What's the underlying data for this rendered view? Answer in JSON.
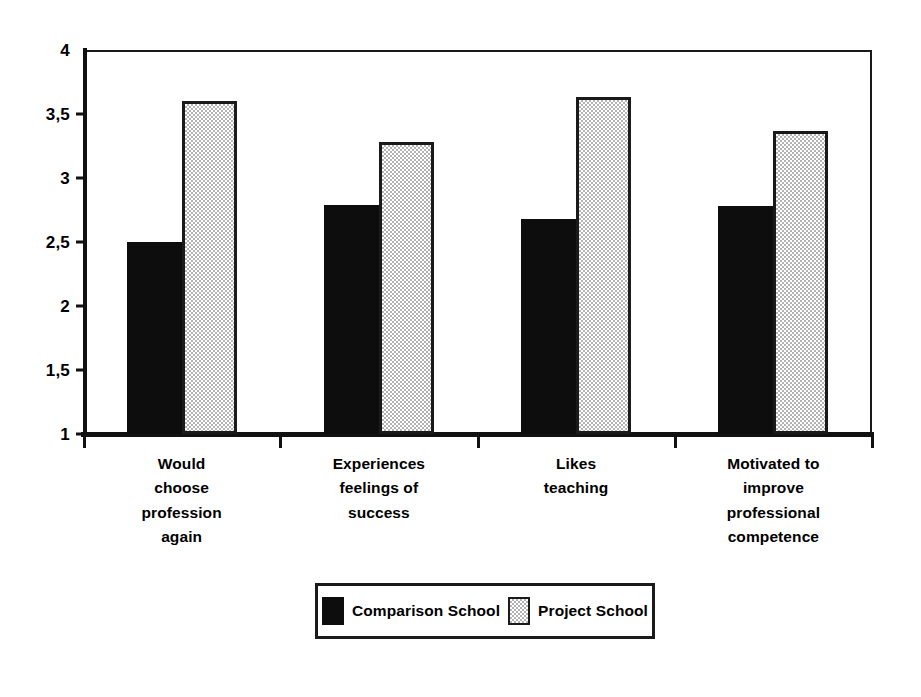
{
  "chart_data": {
    "type": "bar",
    "title": "",
    "subtitle": "",
    "xlabel": "",
    "ylabel": "",
    "ylim": [
      1,
      4
    ],
    "ytick_labels": [
      "1",
      "1,5",
      "2",
      "2,5",
      "3",
      "3,5",
      "4"
    ],
    "ytick_values": [
      1,
      1.5,
      2,
      2.5,
      3,
      3.5,
      4
    ],
    "grid": false,
    "legend_position": "bottom-center",
    "categories": [
      "Would choose profession again",
      "Experiences feelings of success",
      "Likes teaching",
      "Motivated to improve professional competence"
    ],
    "category_label_lines": [
      [
        "Would",
        "choose",
        "profession",
        "again"
      ],
      [
        "Experiences",
        "feelings of",
        "success"
      ],
      [
        "Likes",
        "teaching"
      ],
      [
        "Motivated to",
        "improve",
        "professional",
        "competence"
      ]
    ],
    "series": [
      {
        "name": "Comparison School",
        "color": "#0d0d0d",
        "values": [
          2.5,
          2.79,
          2.68,
          2.78
        ]
      },
      {
        "name": "Project School",
        "color": "#c8c8c8",
        "values": [
          3.6,
          3.28,
          3.63,
          3.37
        ]
      }
    ]
  },
  "legend": {
    "entries": [
      {
        "label": "Comparison School",
        "swatch": "black-fill-swatch"
      },
      {
        "label": "Project School",
        "swatch": "gray-stipple-swatch"
      }
    ]
  }
}
